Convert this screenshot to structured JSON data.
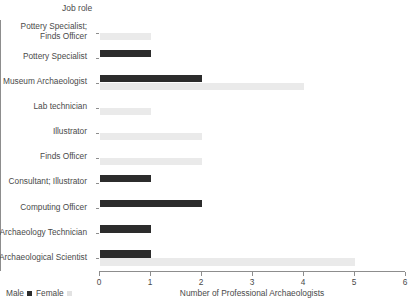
{
  "chart_data": {
    "type": "bar",
    "orientation": "horizontal",
    "title": "",
    "ylabel": "Job role",
    "xlabel": "Number of Professional Archaeologists",
    "xlim": [
      0,
      6
    ],
    "xticks": [
      0,
      1,
      2,
      3,
      4,
      5,
      6
    ],
    "xtick_labels": [
      "0",
      "1",
      "2",
      "3",
      "4",
      "5",
      "6"
    ],
    "grid": false,
    "legend_position": "bottom-left",
    "categories": [
      "Pottery Specialist;\nFinds Officer",
      "Pottery Specialist",
      "Museum Archaeologist",
      "Lab technician",
      "Illustrator",
      "Finds Officer",
      "Consultant; Illustrator",
      "Computing Officer",
      "Archaeology Technician",
      "Archaeological Scientist"
    ],
    "series": [
      {
        "name": "Male",
        "color": "#2c2c2c",
        "values": [
          0,
          1,
          2,
          0,
          0,
          0,
          1,
          2,
          1,
          1
        ]
      },
      {
        "name": "Female",
        "color": "#eaeaea",
        "values": [
          1,
          0,
          4,
          1,
          2,
          2,
          0,
          0,
          0,
          5
        ]
      }
    ]
  },
  "legend": {
    "items": [
      {
        "label": "Male",
        "swatch": "male-swatch"
      },
      {
        "label": "Female",
        "swatch": "female-swatch"
      }
    ]
  }
}
